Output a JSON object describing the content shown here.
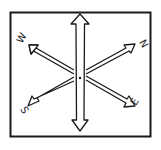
{
  "diagram": {
    "type": "hand-drawn compass rose",
    "colors": {
      "stroke": "#1a1a1a",
      "background": "#ffffff"
    },
    "labels": {
      "upper_left": "W",
      "upper_right": "N",
      "lower_left": "S",
      "lower_right": "E"
    },
    "arrows": [
      {
        "name": "vertical-double-arrow",
        "direction": "up-down"
      },
      {
        "name": "diagonal-arrow-w-e",
        "direction": "upper-left to lower-right"
      },
      {
        "name": "diagonal-arrow-n-s",
        "direction": "upper-right to lower-left"
      }
    ],
    "center_mark": "dot"
  }
}
